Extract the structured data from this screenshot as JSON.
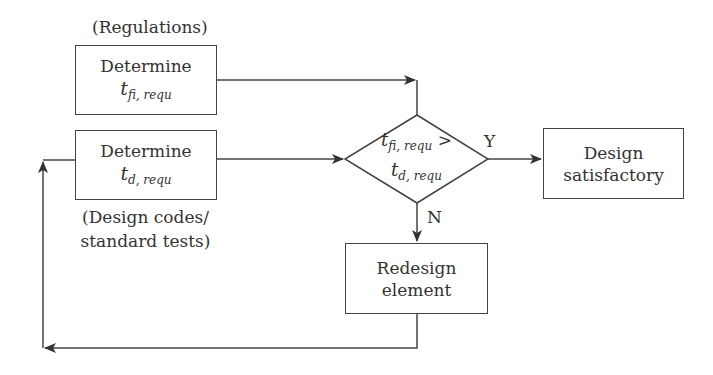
{
  "diagram": {
    "type": "flowchart",
    "nodes": {
      "regulations_label": "(Regulations)",
      "determine_tfi": {
        "line1": "Determine",
        "var": "t",
        "sub": "fi, requ"
      },
      "determine_td": {
        "line1": "Determine",
        "var": "t",
        "sub": "d, requ"
      },
      "design_codes_label": {
        "line1": "(Design codes/",
        "line2": "standard tests)"
      },
      "decision": {
        "var1": "t",
        "sub1": "fi, requ",
        "op": " >",
        "var2": "t",
        "sub2": "d, requ"
      },
      "design_satisfactory": {
        "line1": "Design",
        "line2": "satisfactory"
      },
      "redesign_element": {
        "line1": "Redesign",
        "line2": "element"
      }
    },
    "edge_labels": {
      "yes": "Y",
      "no": "N"
    },
    "colors": {
      "stroke": "#444444",
      "text": "#333333",
      "background": "#ffffff"
    }
  }
}
